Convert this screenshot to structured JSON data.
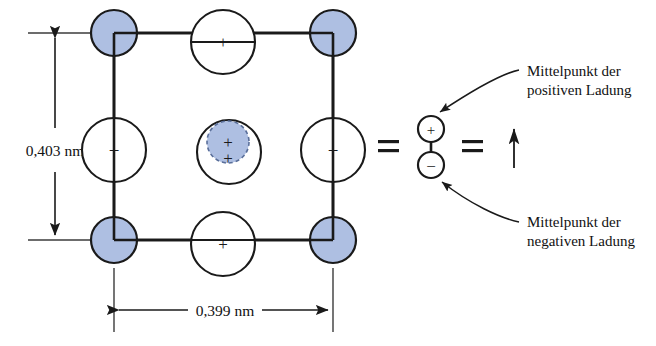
{
  "figure": {
    "dimensions": {
      "vertical_label": "0,403 nm",
      "horizontal_label": "0,399 nm"
    },
    "equals_signs": [
      "=",
      "="
    ],
    "lattice": {
      "blue_color": "#aebfe2",
      "outline_color": "#1a1a1a",
      "white_color": "#ffffff",
      "corner_atoms": [
        {
          "name": "corner-top-left",
          "cx": 114,
          "cy": 33,
          "r": 23,
          "fill": "blue",
          "sign": ""
        },
        {
          "name": "corner-top-right",
          "cx": 333,
          "cy": 33,
          "r": 23,
          "fill": "blue",
          "sign": ""
        },
        {
          "name": "corner-bottom-left",
          "cx": 114,
          "cy": 240,
          "r": 23,
          "fill": "blue",
          "sign": ""
        },
        {
          "name": "corner-bottom-right",
          "cx": 333,
          "cy": 240,
          "r": 23,
          "fill": "blue",
          "sign": ""
        }
      ],
      "face_atoms": [
        {
          "name": "face-top-center",
          "cx": 223,
          "cy": 42,
          "r": 32,
          "fill": "white",
          "sign": "+"
        },
        {
          "name": "face-bottom-center",
          "cx": 223,
          "cy": 244,
          "r": 32,
          "fill": "white",
          "sign": "+"
        },
        {
          "name": "face-mid-left",
          "cx": 114,
          "cy": 150,
          "r": 32,
          "fill": "white",
          "sign": "−"
        },
        {
          "name": "face-mid-right",
          "cx": 333,
          "cy": 150,
          "r": 32,
          "fill": "white",
          "sign": "−"
        }
      ],
      "center_atom": {
        "name": "center-atom-outer",
        "cx": 229,
        "cy": 152,
        "r": 32,
        "fill": "white",
        "inner": {
          "name": "center-atom-inner-displaced",
          "cx": 228,
          "cy": 142,
          "r": 21,
          "fill": "blue",
          "dashed": true
        },
        "sign_upper": "+",
        "sign_lower": "+"
      }
    },
    "dipole": {
      "positive_circle": {
        "name": "dipole-positive",
        "cx": 431,
        "cy": 129,
        "r": 13,
        "sign": "+"
      },
      "negative_circle": {
        "name": "dipole-negative",
        "cx": 431,
        "cy": 165,
        "r": 13,
        "sign": "−"
      },
      "arrow_direction": "up"
    },
    "callouts": [
      {
        "name": "callout-positive",
        "line1": "Mittelpunkt der",
        "line2": "positiven Ladung"
      },
      {
        "name": "callout-negative",
        "line1": "Mittelpunkt der",
        "line2": "negativen Ladung"
      }
    ]
  }
}
